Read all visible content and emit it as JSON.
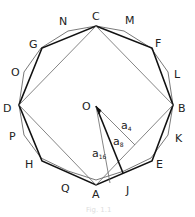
{
  "diagram": {
    "center_label": "O",
    "vertex_labels": {
      "C": "C",
      "M": "M",
      "F": "F",
      "L": "L",
      "B": "B",
      "K": "K",
      "E": "E",
      "J": "J",
      "A": "A",
      "Q": "Q",
      "H": "H",
      "P": "P",
      "D": "D",
      "O2": "O",
      "G": "G",
      "N": "N"
    },
    "segment_labels": {
      "a4": "a",
      "a4_sub": "4",
      "a8": "a",
      "a8_sub": "8",
      "a16": "a",
      "a16_sub": "16"
    },
    "caption": "Fig. 1.1"
  }
}
